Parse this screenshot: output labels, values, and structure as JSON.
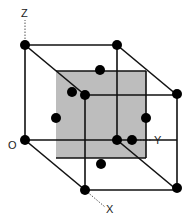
{
  "diagram": {
    "axes": {
      "z": {
        "label": "Z"
      },
      "y": {
        "label": "Y"
      },
      "x": {
        "label": "X"
      },
      "origin": {
        "label": "O"
      }
    },
    "colors": {
      "line": "#111111",
      "shaded_plane": "#bdbdbd",
      "atom": "#000000",
      "axis_dotted": "#555555"
    },
    "atom_count_visible": 14
  }
}
